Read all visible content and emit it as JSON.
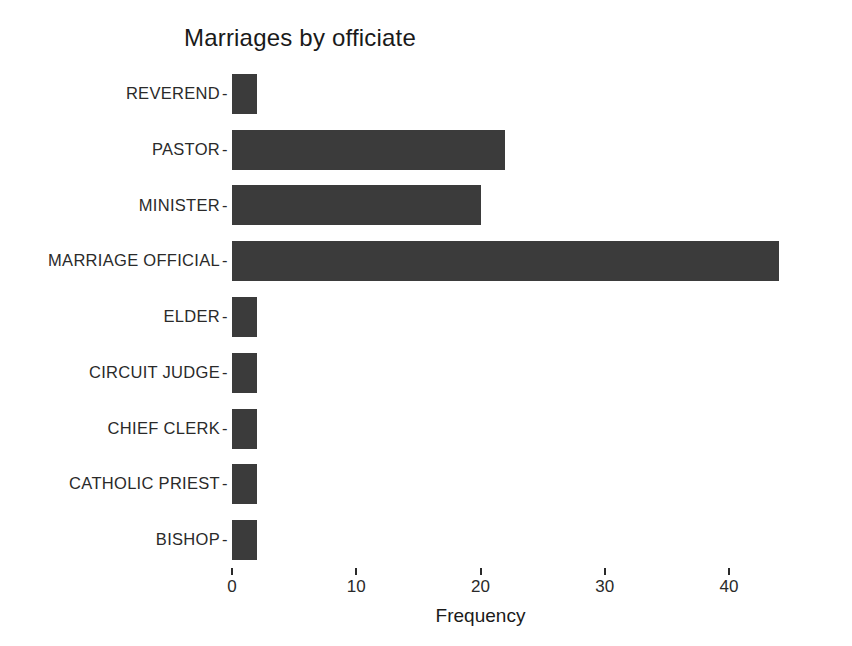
{
  "chart_data": {
    "type": "bar",
    "orientation": "horizontal",
    "title": "Marriages by officiate",
    "xlabel": "Frequency",
    "ylabel": "",
    "categories": [
      "REVEREND",
      "PASTOR",
      "MINISTER",
      "MARRIAGE OFFICIAL",
      "ELDER",
      "CIRCUIT JUDGE",
      "CHIEF CLERK",
      "CATHOLIC PRIEST",
      "BISHOP"
    ],
    "values": [
      2,
      22,
      20,
      44,
      2,
      2,
      2,
      2,
      2
    ],
    "xticks": [
      0,
      10,
      20,
      30,
      40
    ],
    "xticklabels": [
      "0",
      "10",
      "20",
      "30",
      "40"
    ],
    "xlim": [
      0,
      40
    ],
    "grid": false,
    "legend": null,
    "bar_color": "#3b3b3b",
    "background_color": "#ffffff",
    "tick_dash": "-"
  }
}
